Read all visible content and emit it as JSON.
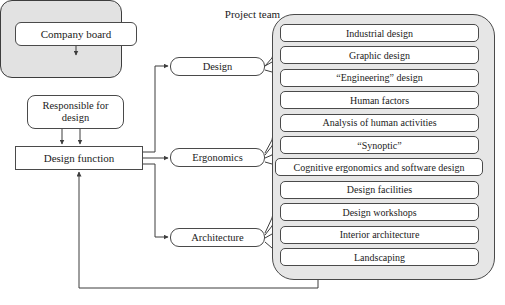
{
  "diagram": {
    "nodes": {
      "company_board": "Company board",
      "project_team": "Project team",
      "responsible_for_design": "Responsible for design",
      "design_function": "Design function"
    },
    "categories": [
      {
        "id": "design",
        "label": "Design"
      },
      {
        "id": "ergonomics",
        "label": "Ergonomics"
      },
      {
        "id": "architecture",
        "label": "Architecture"
      }
    ],
    "items": [
      {
        "label": "Industrial design",
        "category": "design",
        "width": "normal"
      },
      {
        "label": "Graphic design",
        "category": "design",
        "width": "normal"
      },
      {
        "label": "“Engineering” design",
        "category": "design",
        "width": "normal"
      },
      {
        "label": "Human factors",
        "category": "ergonomics",
        "width": "normal"
      },
      {
        "label": "Analysis of human activities",
        "category": "ergonomics",
        "width": "normal"
      },
      {
        "label": "“Synoptic”",
        "category": "ergonomics",
        "width": "normal"
      },
      {
        "label": "Cognitive ergonomics and software design",
        "category": "ergonomics",
        "width": "wide"
      },
      {
        "label": "Design facilities",
        "category": "architecture",
        "width": "normal"
      },
      {
        "label": "Design workshops",
        "category": "architecture",
        "width": "normal"
      },
      {
        "label": "Interior architecture",
        "category": "architecture",
        "width": "normal"
      },
      {
        "label": "Landscaping",
        "category": "architecture",
        "width": "normal"
      }
    ],
    "colors": {
      "panel_fill": "#e6e6e6",
      "project_team_fill": "#e2e2e2",
      "box_fill": "#ffffff",
      "stroke": "#4a4a4a",
      "text": "#1b1b1b"
    }
  }
}
